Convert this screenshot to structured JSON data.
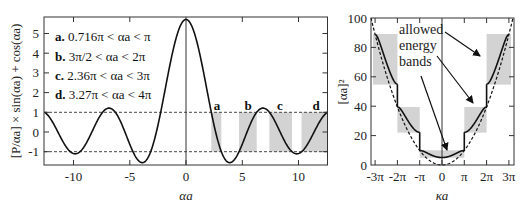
{
  "chart_data": [
    {
      "type": "line",
      "panel": "left",
      "title": "",
      "equation": "[P/αa] × sin(αa) + cos(αa)",
      "P": 4.712,
      "xlabel": "αa",
      "ylabel": "[P/αa] × sin(αa) + cos(αa)",
      "xlim": [
        -12.57,
        12.57
      ],
      "ylim": [
        -1.65,
        5.8
      ],
      "xticks": [
        -10,
        -5,
        0,
        5,
        10
      ],
      "xtick_labels": [
        "-10",
        "-5",
        "0",
        "5",
        "10"
      ],
      "yticks": [
        -1,
        0,
        1,
        2,
        3,
        4,
        5
      ],
      "ytick_labels": [
        "-1",
        "0",
        "1",
        "2",
        "3",
        "4",
        "5"
      ],
      "reference_lines": [
        1,
        -1
      ],
      "x": [
        -12.57,
        -12,
        -11,
        -10,
        -9,
        -8,
        -7,
        -6,
        -5,
        -4.5,
        -4,
        -3.5,
        -3,
        -2.25,
        -2,
        -1,
        0,
        1,
        2,
        2.25,
        3,
        3.5,
        4,
        4.5,
        5,
        6,
        7,
        8,
        9,
        10,
        11,
        12,
        12.57
      ],
      "y": [
        1.0,
        0.633,
        -0.424,
        -1.095,
        -0.695,
        0.437,
        1.196,
        0.741,
        -0.62,
        -1.234,
        -1.545,
        -1.409,
        -0.768,
        1.003,
        1.726,
        4.505,
        5.712,
        4.505,
        1.726,
        1.003,
        -0.768,
        -1.409,
        -1.545,
        -1.234,
        -0.62,
        0.741,
        1.196,
        0.437,
        -0.695,
        -1.095,
        -0.424,
        0.633,
        1.0
      ],
      "shaded_bands": [
        {
          "label": "a",
          "from": 2.25,
          "to": 3.14
        },
        {
          "label": "b",
          "from": 4.71,
          "to": 6.28
        },
        {
          "label": "c",
          "from": 7.41,
          "to": 9.42
        },
        {
          "label": "d",
          "from": 10.27,
          "to": 12.57
        }
      ],
      "legend": [
        {
          "key": "a.",
          "text": "0.716π < αa < π"
        },
        {
          "key": "b.",
          "text": "3π/2 < αa < 2π"
        },
        {
          "key": "c.",
          "text": "2.36π < αa < 3π"
        },
        {
          "key": "d.",
          "text": "3.27π < αa < 4π"
        }
      ],
      "legend_position": "upper left",
      "grid": false
    },
    {
      "type": "line",
      "panel": "right",
      "title": "",
      "xlabel": "κa",
      "ylabel": "[αa]²",
      "xlim": [
        -3.2,
        3.2
      ],
      "xlim_units": "π",
      "ylim": [
        0,
        100
      ],
      "xticks_pi": [
        -3,
        -2,
        -1,
        0,
        1,
        2,
        3
      ],
      "xtick_labels": [
        "-3π",
        "-2π",
        "-π",
        "0",
        "π",
        "2π",
        "3π"
      ],
      "yticks": [
        0,
        20,
        40,
        60,
        80,
        100
      ],
      "ytick_labels": [
        "0",
        "20",
        "40",
        "60",
        "80",
        "100"
      ],
      "series": [
        {
          "name": "allowed energy bands (Kronig–Penney)",
          "style": "solid",
          "bands": [
            {
              "ka_range_pi": [
                -1,
                1
              ],
              "y_range": [
                5.06,
                9.87
              ]
            },
            {
              "ka_range_pi": [
                1,
                2
              ],
              "y_range": [
                22.2,
                39.5
              ]
            },
            {
              "ka_range_pi": [
                2,
                3
              ],
              "y_range": [
                55.0,
                88.8
              ]
            }
          ]
        },
        {
          "name": "free electron",
          "style": "dashed",
          "relation": "y = (κa)²"
        }
      ],
      "shaded_boxes": [
        {
          "ka_pi": [
            -1,
            1
          ],
          "y": [
            5,
            10
          ]
        },
        {
          "ka_pi": [
            -2,
            -1
          ],
          "y": [
            22,
            39.5
          ]
        },
        {
          "ka_pi": [
            1,
            2
          ],
          "y": [
            22,
            39.5
          ]
        },
        {
          "ka_pi": [
            -3.1,
            -2
          ],
          "y": [
            55,
            89
          ]
        },
        {
          "ka_pi": [
            2,
            3.1
          ],
          "y": [
            55,
            89
          ]
        }
      ],
      "annotation": {
        "lines": [
          "allowed",
          "energy",
          "bands"
        ]
      },
      "grid": false
    }
  ],
  "left": {
    "ylabel": "[P/αa] × sin(αa) + cos(αa)",
    "xlabel": "αa",
    "legend": {
      "a_key": "a.",
      "a_text": "0.716π < αa < π",
      "b_key": "b.",
      "b_text": "3π/2 < αa < 2π",
      "c_key": "c.",
      "c_text": "2.36π < αa < 3π",
      "d_key": "d.",
      "d_text": "3.27π < αa < 4π"
    },
    "band_letters": {
      "a": "a",
      "b": "b",
      "c": "c",
      "d": "d"
    },
    "xticks": {
      "t0": "-10",
      "t1": "-5",
      "t2": "0",
      "t3": "5",
      "t4": "10"
    },
    "yticks": {
      "t0": "-1",
      "t1": "0",
      "t2": "1",
      "t3": "2",
      "t4": "3",
      "t5": "4",
      "t6": "5"
    }
  },
  "right": {
    "ylabel": "[αa]²",
    "xlabel": "κa",
    "annotation": {
      "l1": "allowed",
      "l2": "energy",
      "l3": "bands"
    },
    "xticks": {
      "t0": "-3π",
      "t1": "-2π",
      "t2": "-π",
      "t3": "0",
      "t4": "π",
      "t5": "2π",
      "t6": "3π"
    },
    "yticks": {
      "t0": "0",
      "t1": "20",
      "t2": "40",
      "t3": "60",
      "t4": "80",
      "t5": "100"
    }
  },
  "colors": {
    "shade": "#d3d3d3",
    "line": "#111111",
    "axis": "#333333"
  }
}
